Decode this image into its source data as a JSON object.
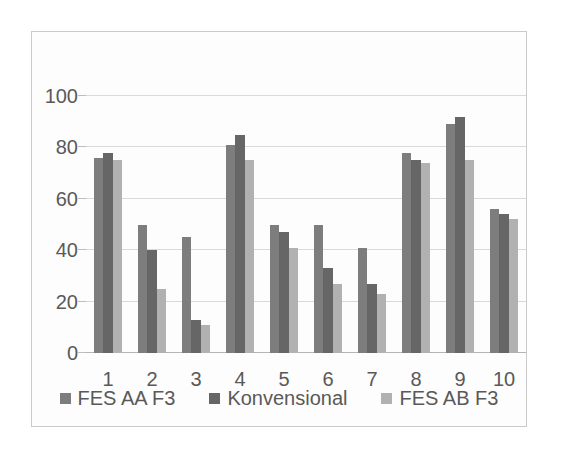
{
  "chart_data": {
    "type": "bar",
    "title": "",
    "xlabel": "",
    "ylabel": "",
    "categories": [
      "1",
      "2",
      "3",
      "4",
      "5",
      "6",
      "7",
      "8",
      "9",
      "10"
    ],
    "series": [
      {
        "name": "FES AA F3",
        "color": "#7d7d7d",
        "values": [
          76,
          50,
          45,
          81,
          50,
          50,
          41,
          78,
          89,
          56
        ]
      },
      {
        "name": "Konvensional",
        "color": "#666666",
        "values": [
          78,
          40,
          13,
          85,
          47,
          33,
          27,
          75,
          92,
          54
        ]
      },
      {
        "name": "FES AB F3",
        "color": "#b1b1b1",
        "values": [
          75,
          25,
          11,
          75,
          41,
          27,
          23,
          74,
          75,
          52
        ]
      }
    ],
    "ylim": [
      0,
      125
    ],
    "yticks": [
      0,
      20,
      40,
      60,
      80,
      100
    ],
    "grid": true,
    "legend_position": "bottom"
  },
  "colors": {
    "gridline": "#d9d9d9",
    "axis_baseline": "#b5b5b5",
    "tick_mark": "#bdbdbd",
    "label_text": "#595959",
    "frame_border": "#cacaca",
    "chart_background": "#fdfdfd"
  }
}
